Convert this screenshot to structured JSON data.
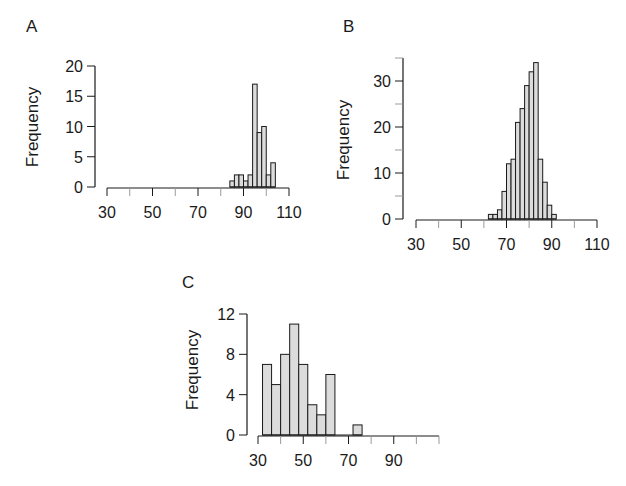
{
  "chart_data": [
    {
      "type": "bar",
      "panel": "A",
      "title": "",
      "xlabel": "",
      "ylabel": "Frequency",
      "bin_width": 2,
      "bin_starts": [
        84,
        86,
        88,
        90,
        92,
        94,
        96,
        98,
        100,
        102
      ],
      "values": [
        1,
        2,
        2,
        1,
        2,
        17,
        9,
        10,
        2,
        4
      ],
      "xlim": [
        30,
        110
      ],
      "ylim": [
        0,
        20
      ],
      "xticks": [
        30,
        40,
        50,
        60,
        70,
        80,
        90,
        100,
        110
      ],
      "xtick_labels": [
        "30",
        "50",
        "70",
        "90",
        "110"
      ],
      "xtick_label_values": [
        30,
        50,
        70,
        90,
        110
      ],
      "yticks": [
        0,
        5,
        10,
        15,
        20
      ],
      "ytick_labels": [
        "0",
        "5",
        "10",
        "15",
        "20"
      ],
      "grid": false
    },
    {
      "type": "bar",
      "panel": "B",
      "title": "",
      "xlabel": "",
      "ylabel": "Frequency",
      "bin_width": 2,
      "bin_starts": [
        62,
        64,
        66,
        68,
        70,
        72,
        74,
        76,
        78,
        80,
        82,
        84,
        86,
        88,
        90
      ],
      "values": [
        1,
        1,
        2,
        6,
        12,
        13,
        21,
        24,
        29,
        32,
        34,
        13,
        8,
        3,
        1
      ],
      "xlim": [
        30,
        110
      ],
      "ylim": [
        0,
        35
      ],
      "xticks": [
        30,
        40,
        50,
        60,
        70,
        80,
        90,
        100,
        110
      ],
      "xtick_labels": [
        "30",
        "50",
        "70",
        "90",
        "110"
      ],
      "xtick_label_values": [
        30,
        50,
        70,
        90,
        110
      ],
      "yticks": [
        0,
        5,
        10,
        15,
        20,
        25,
        30,
        35
      ],
      "ytick_labels": [
        "0",
        "10",
        "20",
        "30"
      ],
      "ytick_label_values": [
        0,
        10,
        20,
        30
      ],
      "grid": false
    },
    {
      "type": "bar",
      "panel": "C",
      "title": "",
      "xlabel": "",
      "ylabel": "Frequency",
      "bin_width": 4,
      "bin_starts": [
        32,
        36,
        40,
        44,
        48,
        52,
        56,
        60,
        64,
        68,
        72
      ],
      "values": [
        7,
        5,
        8,
        11,
        7,
        3,
        2,
        6,
        0,
        0,
        1
      ],
      "xlim": [
        30,
        110
      ],
      "ylim": [
        0,
        12
      ],
      "xticks": [
        30,
        40,
        50,
        60,
        70,
        80,
        90,
        100,
        110
      ],
      "xtick_labels": [
        "30",
        "50",
        "70",
        "90"
      ],
      "xtick_label_values": [
        30,
        50,
        70,
        90
      ],
      "yticks": [
        0,
        4,
        8,
        12
      ],
      "ytick_labels": [
        "0",
        "4",
        "8",
        "12"
      ],
      "grid": false
    }
  ],
  "style": {
    "bar_fill": "#dcdcdc",
    "bar_stroke": "#1a1a1a",
    "axis_color": "#1a1a1a",
    "minor_tick_color": "#9a9a9a"
  }
}
